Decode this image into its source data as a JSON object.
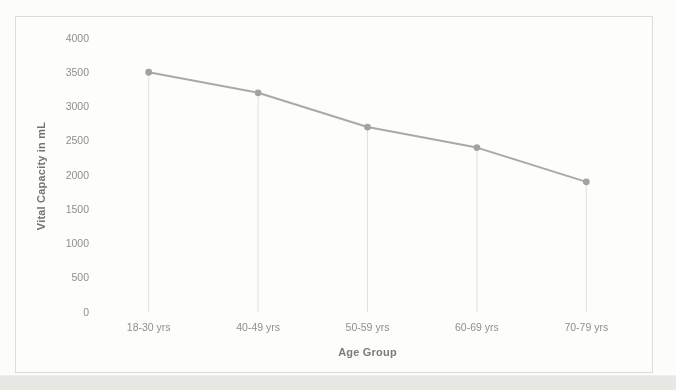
{
  "chart_data": {
    "type": "line",
    "categories": [
      "18-30 yrs",
      "40-49 yrs",
      "50-59 yrs",
      "60-69 yrs",
      "70-79 yrs"
    ],
    "values": [
      3500,
      3200,
      2700,
      2400,
      1900
    ],
    "title": "",
    "xlabel": "Age Group",
    "ylabel": "Vital Capacity in mL",
    "ylim": [
      0,
      4000
    ],
    "yticks": [
      0,
      500,
      1000,
      1500,
      2000,
      2500,
      3000,
      3500,
      4000
    ],
    "grid": false,
    "drop_lines": true,
    "legend": "none",
    "colors": {
      "line": "#a9a9a9",
      "marker": "#a2a2a2",
      "drop_line": "#e1e1df",
      "frame_border": "#dcdcda",
      "tick_text": "#8f8f8f",
      "axis_title_text": "#737373"
    }
  }
}
